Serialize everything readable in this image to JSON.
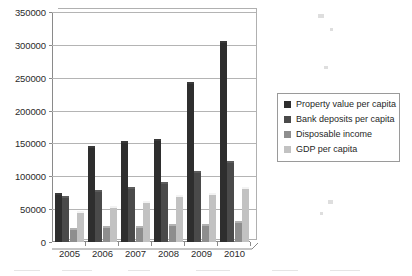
{
  "chart_data": {
    "type": "bar",
    "title": "",
    "subtitle": "",
    "xlabel": "",
    "ylabel": "",
    "categories": [
      "2005",
      "2006",
      "2007",
      "2008",
      "2009",
      "2010"
    ],
    "ylim": [
      0,
      350000
    ],
    "ytick_values": [
      0,
      50000,
      100000,
      150000,
      200000,
      250000,
      300000,
      350000
    ],
    "ytick_labels": [
      "0",
      "50000",
      "100000",
      "150000",
      "200000",
      "250000",
      "300000",
      "350000"
    ],
    "grid": true,
    "legend_position": "right",
    "series": [
      {
        "name": "Property value per capita",
        "color": "#2e2e2e",
        "values": [
          71000,
          143000,
          150000,
          153000,
          241000,
          303000
        ]
      },
      {
        "name": "Bank deposits per capita",
        "color": "#4a4a4a",
        "values": [
          67000,
          76000,
          80000,
          89000,
          105000,
          120000
        ]
      },
      {
        "name": "Disposable income",
        "color": "#8e8e8e",
        "values": [
          19000,
          21000,
          22000,
          24000,
          25000,
          29000
        ]
      },
      {
        "name": "GDP per capita",
        "color": "#c2c2c2",
        "values": [
          44000,
          52000,
          59000,
          69000,
          72000,
          81000
        ]
      }
    ]
  }
}
